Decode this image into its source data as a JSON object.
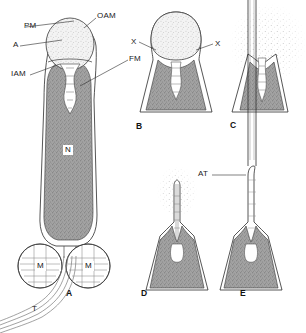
{
  "figure": {
    "background_color": "#ffffff",
    "ink_color": "#1a1a1a",
    "nucleus_fill": "#9a9a9a",
    "acrosome_fill": "#ececec",
    "membrane_fill": "#ffffff"
  },
  "leader_labels": {
    "pm": "PM",
    "oam": "OAM",
    "a": "A",
    "iam": "IAM",
    "fm": "FM",
    "n": "N",
    "m_left": "M",
    "m_right": "M",
    "t": "T",
    "x_left": "X",
    "x_right": "X",
    "at": "AT"
  },
  "panels": [
    {
      "id": "A",
      "label": "A",
      "caption": "Intact sperm head with acrosome"
    },
    {
      "id": "B",
      "label": "B",
      "caption": "Membrane fusion points"
    },
    {
      "id": "C",
      "label": "C",
      "caption": "Acrosomal contents dispersing"
    },
    {
      "id": "D",
      "label": "D",
      "caption": "Acrosomal process emerging"
    },
    {
      "id": "E",
      "label": "E",
      "caption": "Acrosomal tubule fully extended"
    }
  ]
}
